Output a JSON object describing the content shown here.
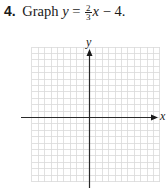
{
  "problem": {
    "number": "4.",
    "prefix": "Graph",
    "var_y": "y",
    "equals": "=",
    "frac_num": "2",
    "frac_den": "3",
    "var_x": "x",
    "rest": "− 4."
  },
  "graph": {
    "x_label": "x",
    "y_label": "y",
    "grid_color": "#d9d9d9",
    "axis_color": "#2a2a2a"
  },
  "chart_data": {
    "type": "line",
    "xlabel": "x",
    "ylabel": "y",
    "grid": true,
    "xlim": [
      -9,
      11
    ],
    "ylim": [
      -10,
      11
    ],
    "series": [],
    "note": "Blank coordinate grid; no line plotted yet"
  }
}
